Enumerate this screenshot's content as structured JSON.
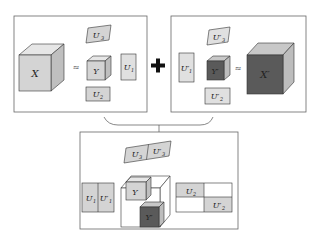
{
  "diagram": {
    "left_panel": {
      "tensor": "X",
      "approx": "≈",
      "core": "Y",
      "factors": [
        "U1",
        "U2",
        "U3"
      ],
      "factor_labels": {
        "u1": "U",
        "u1_sub": "1",
        "u2": "U",
        "u2_sub": "2",
        "u3": "U",
        "u3_sub": "3"
      }
    },
    "operator": "+",
    "right_panel": {
      "tensor": "X'",
      "approx": "≈",
      "core": "Y'",
      "factors": [
        "U1'",
        "U2'",
        "U3'"
      ]
    },
    "bottom_panel": {
      "description": "Combined block-diagonal core and concatenated factor matrices",
      "core_blocks": [
        "Y",
        "Y'"
      ],
      "factor_pairs": [
        [
          "U1",
          "U1'"
        ],
        [
          "U2",
          "U2'"
        ],
        [
          "U3",
          "U3'"
        ]
      ]
    },
    "labels": {
      "X": "X",
      "Xp": "X′",
      "Y": "Y",
      "Yp": "Y′",
      "U": "U",
      "Up": "U′",
      "s1": "1",
      "s2": "2",
      "s3": "3",
      "approx": "≈",
      "plus": "+"
    },
    "colors": {
      "light_fill": "#d4d4d4",
      "light_top": "#e6e6e6",
      "light_side": "#bfbfbf",
      "dark_fill": "#5a5a5a",
      "dark_top": "#c8c8c8",
      "dark_side": "#bdbdbd",
      "stroke": "#333333",
      "panel_border": "#666666"
    },
    "caption": ""
  }
}
